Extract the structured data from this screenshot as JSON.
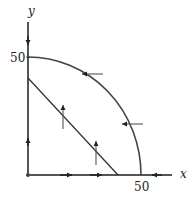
{
  "diagram": {
    "type": "phase-plane",
    "axes": {
      "x_label": "x",
      "y_label": "y",
      "x_tick_label": "50",
      "y_tick_label": "50",
      "color": "#555555"
    },
    "curves": [
      {
        "name": "quarter-circle-nullcline",
        "kind": "arc",
        "from": [
          0,
          50
        ],
        "to": [
          50,
          0
        ],
        "color": "#444444"
      },
      {
        "name": "line-nullcline",
        "kind": "line",
        "from": [
          0,
          40
        ],
        "to": [
          40,
          0
        ],
        "color": "#333333"
      }
    ],
    "direction_arrows": [
      {
        "location": "y-axis upper",
        "direction": "down"
      },
      {
        "location": "y-axis lower",
        "direction": "up"
      },
      {
        "location": "x-axis left",
        "direction": "right"
      },
      {
        "location": "x-axis middle",
        "direction": "right"
      },
      {
        "location": "x-axis right of circle",
        "direction": "left"
      },
      {
        "location": "on arc upper",
        "direction": "left"
      },
      {
        "location": "on arc lower",
        "direction": "left"
      },
      {
        "location": "on line upper",
        "direction": "up"
      },
      {
        "location": "on line lower",
        "direction": "up"
      }
    ]
  }
}
